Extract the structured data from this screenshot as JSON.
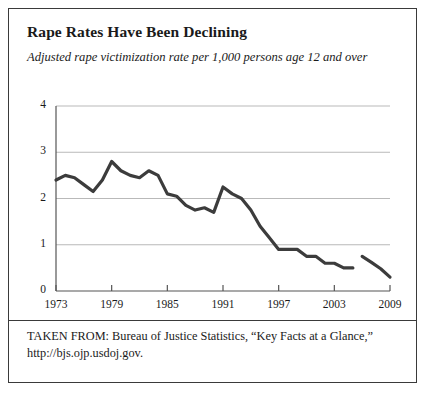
{
  "figure": {
    "title": "Rape Rates Have Been Declining",
    "subtitle": "Adjusted rape victimization rate per 1,000 persons age 12 and over",
    "source_prefix": "TAKEN FROM: Bureau of Justice Statistics, “Key Facts at a Glance,”",
    "source_url": "http://bjs.ojp.usdoj.gov.",
    "border_color": "#3a3a3a",
    "background_color": "#ffffff"
  },
  "chart_data": {
    "type": "line",
    "title": "Rape Rates Have Been Declining",
    "subtitle": "Adjusted rape victimization rate per 1,000 persons age 12 and over",
    "xlabel": "",
    "ylabel": "",
    "xlim": [
      1973,
      2009
    ],
    "ylim": [
      0,
      4
    ],
    "grid": "horizontal",
    "legend": "none",
    "line_color": "#3c3c3c",
    "line_width": 3.2,
    "gridline_color": "#b9b9b9",
    "axis_color": "#555555",
    "ytick_labels": [
      "0",
      "1",
      "2",
      "3",
      "4"
    ],
    "ytick_values": [
      0,
      1,
      2,
      3,
      4
    ],
    "xtick_labels": [
      "1973",
      "1979",
      "1985",
      "1991",
      "1997",
      "2003",
      "2009"
    ],
    "xtick_values": [
      1973,
      1979,
      1985,
      1991,
      1997,
      2003,
      2009
    ],
    "series": [
      {
        "name": "Adjusted rape victimization rate",
        "x": [
          1973,
          1974,
          1975,
          1976,
          1977,
          1978,
          1979,
          1980,
          1981,
          1982,
          1983,
          1984,
          1985,
          1986,
          1987,
          1988,
          1989,
          1990,
          1991,
          1992,
          1993,
          1994,
          1995,
          1996,
          1997,
          1998,
          1999,
          2000,
          2001,
          2002,
          2003,
          2004,
          2005
        ],
        "values": [
          2.4,
          2.5,
          2.45,
          2.3,
          2.15,
          2.4,
          2.8,
          2.6,
          2.5,
          2.45,
          2.6,
          2.5,
          2.1,
          2.05,
          1.85,
          1.75,
          1.8,
          1.7,
          2.25,
          2.1,
          2.0,
          1.75,
          1.4,
          1.15,
          0.9,
          0.9,
          0.9,
          0.75,
          0.75,
          0.6,
          0.6,
          0.5,
          0.5
        ]
      },
      {
        "name": "Adjusted rape victimization rate (continued)",
        "x": [
          2006,
          2007,
          2008,
          2009
        ],
        "values": [
          0.75,
          0.62,
          0.48,
          0.3
        ]
      }
    ]
  }
}
